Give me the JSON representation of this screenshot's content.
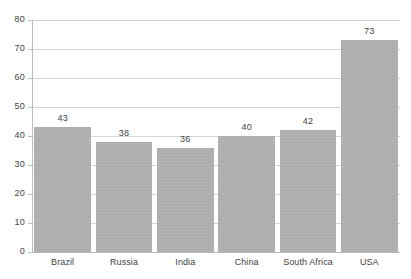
{
  "chart_data": {
    "type": "bar",
    "title": "",
    "subtitle": "",
    "xlabel": "",
    "ylabel": "",
    "categories": [
      "Brazil",
      "Russia",
      "India",
      "China",
      "South Africa",
      "USA"
    ],
    "values": [
      43,
      38,
      36,
      40,
      42,
      73
    ],
    "data_labels": [
      "43",
      "38",
      "36",
      "40",
      "42",
      "73"
    ],
    "ylim": [
      0,
      80
    ],
    "y_ticks": [
      0,
      10,
      20,
      30,
      40,
      50,
      60,
      70,
      80
    ],
    "y_tick_labels": [
      "0",
      "10",
      "20",
      "30",
      "40",
      "50",
      "60",
      "70",
      "80"
    ],
    "grid": true,
    "grid_axis": "y",
    "legend": false,
    "legend_position": "none",
    "series": [
      {
        "name": "",
        "values": [
          43,
          38,
          36,
          40,
          42,
          73
        ]
      }
    ]
  },
  "style": {
    "bar_color": "#b2b2b2",
    "grid_color": "#d6d6d6",
    "axis_color": "#bdbdbd",
    "text_color": "#3f3f3f",
    "background": "#ffffff"
  }
}
